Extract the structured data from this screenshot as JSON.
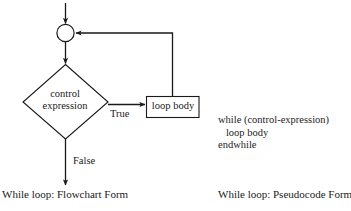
{
  "figure": {
    "background_color": "#ffffff",
    "ink_color": "#1a1a1a"
  },
  "flowchart": {
    "entry_arrow": {
      "name": "entry-arrow"
    },
    "connector_node": {
      "shape": "circle",
      "label": ""
    },
    "decision": {
      "shape": "diamond",
      "line1": "control",
      "line2": "expression"
    },
    "process": {
      "shape": "rectangle",
      "label": "loop body"
    },
    "edges": {
      "true_label": "True",
      "false_label": "False"
    },
    "caption": "While loop: Flowchart Form"
  },
  "pseudocode": {
    "lines": [
      "while (control-expression)",
      "   loop body",
      "endwhile"
    ],
    "caption": "While loop: Pseudocode Form"
  }
}
